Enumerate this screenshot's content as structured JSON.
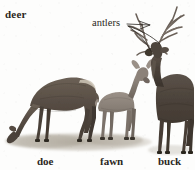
{
  "figure": {
    "title_label": "deer",
    "background_color": "#fdfdfc",
    "ink_color": "#2b2722",
    "width": 195,
    "height": 170
  },
  "callouts": [
    {
      "id": "antlers",
      "label": "antlers",
      "points_to": "buck-antlers",
      "leader_lines": 2
    }
  ],
  "specimens": [
    {
      "id": "doe",
      "label": "doe",
      "pose": "grazing-head-down",
      "facing": "left",
      "has_antlers": false,
      "coat_color": "#5d5248"
    },
    {
      "id": "fawn",
      "label": "fawn",
      "pose": "standing",
      "facing": "right",
      "has_antlers": false,
      "coat_color": "#8b8077"
    },
    {
      "id": "buck",
      "label": "buck",
      "pose": "standing-alert",
      "facing": "left",
      "has_antlers": true,
      "coat_color": "#4e453c"
    }
  ],
  "ground": {
    "label": "ground-shadow",
    "color": "#b9b2a6"
  }
}
